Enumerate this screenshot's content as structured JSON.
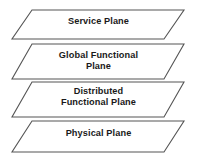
{
  "diagram": {
    "background_color": "#ffffff",
    "shape_type": "parallelogram-stack",
    "border_color": "#555555",
    "fill_color": "#ffffff",
    "text_color": "#1a1a1a",
    "skew_offset_px": 20,
    "layers": [
      {
        "id": "service-plane",
        "label": "Service Plane",
        "order": 1,
        "top_y": 10,
        "bottom_y": 39
      },
      {
        "id": "global-functional-plane",
        "label": "Global Functional\nPlane",
        "order": 2,
        "top_y": 44,
        "bottom_y": 79
      },
      {
        "id": "distributed-functional-plane",
        "label": "Distributed\nFunctional Plane",
        "order": 3,
        "top_y": 82,
        "bottom_y": 117
      },
      {
        "id": "physical-plane",
        "label": "Physical Plane",
        "order": 4,
        "top_y": 121,
        "bottom_y": 152
      }
    ]
  }
}
